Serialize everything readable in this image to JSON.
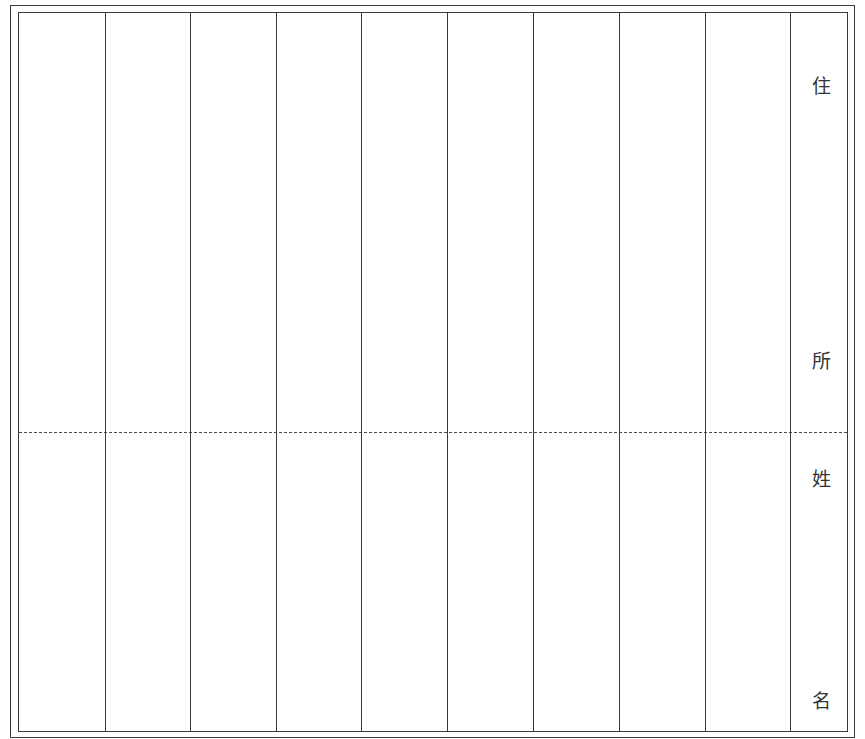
{
  "form": {
    "header_column": {
      "address_label": [
        "住",
        "所"
      ],
      "name_label": [
        "姓",
        "名"
      ]
    },
    "columns": 9,
    "rows": [
      "住所",
      "姓名"
    ],
    "entries": [
      {
        "address": "",
        "name": ""
      },
      {
        "address": "",
        "name": ""
      },
      {
        "address": "",
        "name": ""
      },
      {
        "address": "",
        "name": ""
      },
      {
        "address": "",
        "name": ""
      },
      {
        "address": "",
        "name": ""
      },
      {
        "address": "",
        "name": ""
      },
      {
        "address": "",
        "name": ""
      },
      {
        "address": "",
        "name": ""
      }
    ]
  },
  "colors": {
    "line": "#3a3a3a",
    "background": "#ffffff"
  }
}
